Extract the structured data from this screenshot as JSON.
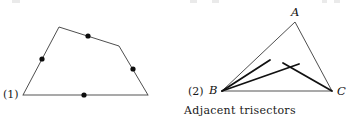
{
  "canvas": {
    "width": 354,
    "height": 125,
    "background": "#ffffff"
  },
  "style": {
    "stroke_thin": "#3a3a3a",
    "stroke_thick": "#111111",
    "baseline_gray": "#8c8c8c",
    "dot_color": "#0d0d0d",
    "text_color": "#1a1a1a"
  },
  "figures": [
    {
      "id": "figure-1",
      "number_label": "(1)",
      "number_label_x": 3,
      "number_label_y": 89,
      "type": "pentagon-with-edge-points",
      "vertices": [
        {
          "name": "bottom-left",
          "x": 23,
          "y": 95
        },
        {
          "name": "apex-left",
          "x": 59,
          "y": 27
        },
        {
          "name": "upper-right-bend",
          "x": 119,
          "y": 46
        },
        {
          "name": "bottom-right",
          "x": 148,
          "y": 95
        }
      ],
      "polygon_points": "23,95 59,27 119,46 148,95",
      "edge_points": [
        {
          "name": "point-left-edge",
          "x": 42,
          "y": 59
        },
        {
          "name": "point-top-edge",
          "x": 88,
          "y": 36
        },
        {
          "name": "point-right-edge",
          "x": 133,
          "y": 69
        },
        {
          "name": "point-bottom-edge",
          "x": 84,
          "y": 95
        }
      ],
      "dot_radius": 2.6
    },
    {
      "id": "figure-2",
      "number_label": "(2)",
      "number_label_x": 188,
      "number_label_y": 86,
      "type": "triangle-with-adjacent-trisectors",
      "vertices": [
        {
          "name": "A",
          "label": "A",
          "x": 295,
          "y": 22,
          "label_x": 291,
          "label_y": 7
        },
        {
          "name": "B",
          "label": "B",
          "x": 222,
          "y": 91,
          "label_x": 209,
          "label_y": 85
        },
        {
          "name": "C",
          "label": "C",
          "x": 332,
          "y": 91,
          "label_x": 337,
          "label_y": 86
        }
      ],
      "triangle_points": "295,22 222,91 332,91",
      "trisector_segments": [
        {
          "name": "trisector-b-upper",
          "from": "B",
          "x1": 222,
          "y1": 91,
          "x2": 270,
          "y2": 60
        },
        {
          "name": "trisector-b-lower",
          "from": "B",
          "x1": 222,
          "y1": 91,
          "x2": 299,
          "y2": 64
        },
        {
          "name": "trisector-c-upper",
          "from": "C",
          "x1": 332,
          "y1": 91,
          "x2": 283,
          "y2": 63
        }
      ],
      "intersection_point": {
        "name": "trisector-crossing",
        "x": 290,
        "y": 68
      }
    }
  ],
  "caption": {
    "text": "Adjacent trisectors"
  },
  "top_artifacts": [
    {
      "x": 12,
      "width": 8
    },
    {
      "x": 190,
      "width": 7
    },
    {
      "x": 212,
      "width": 7
    },
    {
      "x": 322,
      "width": 5
    },
    {
      "x": 334,
      "width": 6
    }
  ]
}
